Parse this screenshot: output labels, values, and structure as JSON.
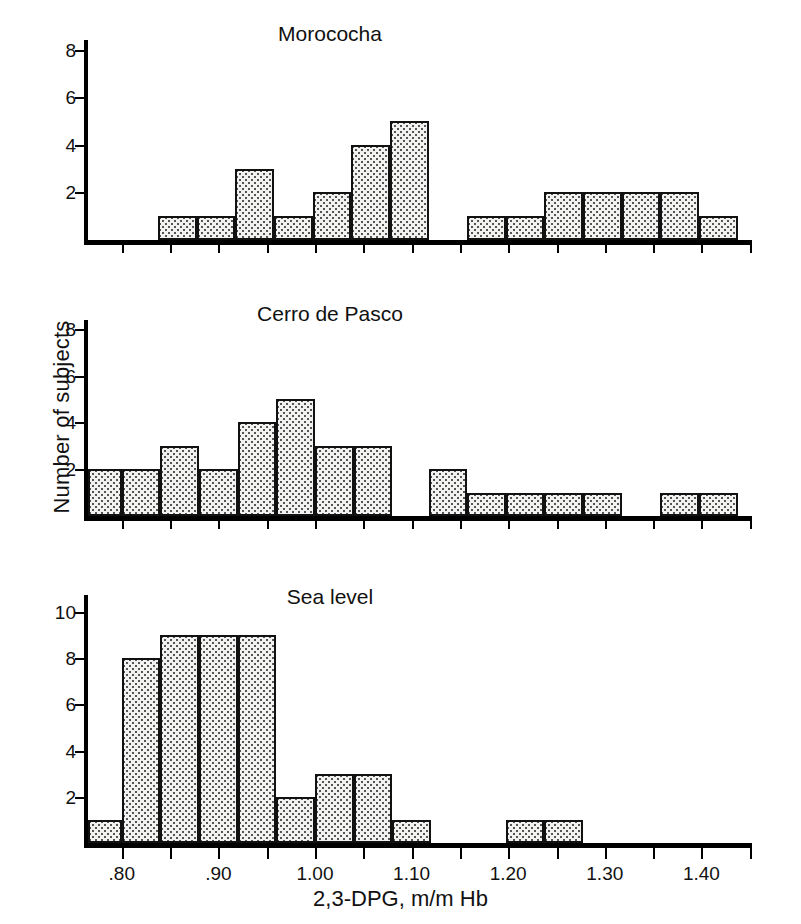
{
  "figure": {
    "y_axis_title": "Number of subjects",
    "x_axis_title": "2,3-DPG, m/m Hb"
  },
  "chart_data": {
    "type": "bar",
    "title": "",
    "xlabel": "2,3-DPG, m/m Hb",
    "ylabel": "Number of subjects",
    "bin_width": 0.04,
    "xlim": [
      0.765,
      1.45
    ],
    "xticks": [
      0.8,
      0.85,
      0.9,
      0.95,
      1.0,
      1.05,
      1.1,
      1.15,
      1.2,
      1.25,
      1.3,
      1.35,
      1.4,
      1.45
    ],
    "xtick_labels": [
      {
        "value": 0.8,
        "label": ".80"
      },
      {
        "value": 0.9,
        "label": ".90"
      },
      {
        "value": 1.0,
        "label": "1.00"
      },
      {
        "value": 1.1,
        "label": "1.10"
      },
      {
        "value": 1.2,
        "label": "1.20"
      },
      {
        "value": 1.3,
        "label": "1.30"
      },
      {
        "value": 1.4,
        "label": "1.40"
      }
    ],
    "panels": [
      {
        "name": "morococha",
        "title": "Morococha",
        "ylim": [
          0,
          8
        ],
        "yticks": [
          2,
          4,
          6,
          8
        ],
        "ytick_labels": [
          "2",
          "4",
          "6",
          "8"
        ],
        "bins": [
          {
            "x0": 0.8375,
            "x1": 0.8775,
            "count": 1
          },
          {
            "x0": 0.8775,
            "x1": 0.9175,
            "count": 1
          },
          {
            "x0": 0.9175,
            "x1": 0.9575,
            "count": 3
          },
          {
            "x0": 0.9575,
            "x1": 0.9975,
            "count": 1
          },
          {
            "x0": 0.9975,
            "x1": 1.0375,
            "count": 2
          },
          {
            "x0": 1.0375,
            "x1": 1.0775,
            "count": 4
          },
          {
            "x0": 1.0775,
            "x1": 1.1175,
            "count": 5
          },
          {
            "x0": 1.1575,
            "x1": 1.1975,
            "count": 1
          },
          {
            "x0": 1.1975,
            "x1": 1.2375,
            "count": 1
          },
          {
            "x0": 1.2375,
            "x1": 1.2775,
            "count": 2
          },
          {
            "x0": 1.2775,
            "x1": 1.3175,
            "count": 2
          },
          {
            "x0": 1.3175,
            "x1": 1.3575,
            "count": 2
          },
          {
            "x0": 1.3575,
            "x1": 1.3975,
            "count": 2
          },
          {
            "x0": 1.3975,
            "x1": 1.4375,
            "count": 1
          }
        ]
      },
      {
        "name": "cerro-de-pasco",
        "title": "Cerro de Pasco",
        "ylim": [
          0,
          9
        ],
        "yticks": [
          2,
          4,
          6,
          8
        ],
        "ytick_labels": [
          "2",
          "4",
          "6",
          "8"
        ],
        "bins": [
          {
            "x0": 0.765,
            "x1": 0.8,
            "count": 2
          },
          {
            "x0": 0.8,
            "x1": 0.84,
            "count": 2
          },
          {
            "x0": 0.84,
            "x1": 0.88,
            "count": 3
          },
          {
            "x0": 0.88,
            "x1": 0.92,
            "count": 2
          },
          {
            "x0": 0.92,
            "x1": 0.96,
            "count": 4
          },
          {
            "x0": 0.96,
            "x1": 1.0,
            "count": 5
          },
          {
            "x0": 1.0,
            "x1": 1.04,
            "count": 3
          },
          {
            "x0": 1.04,
            "x1": 1.08,
            "count": 3
          },
          {
            "x0": 1.1175,
            "x1": 1.1575,
            "count": 2
          },
          {
            "x0": 1.1575,
            "x1": 1.1975,
            "count": 1
          },
          {
            "x0": 1.1975,
            "x1": 1.2375,
            "count": 1
          },
          {
            "x0": 1.2375,
            "x1": 1.2775,
            "count": 1
          },
          {
            "x0": 1.2775,
            "x1": 1.3175,
            "count": 1
          },
          {
            "x0": 1.3575,
            "x1": 1.3975,
            "count": 1
          },
          {
            "x0": 1.3975,
            "x1": 1.4375,
            "count": 1
          }
        ]
      },
      {
        "name": "sea-level",
        "title": "Sea level",
        "ylim": [
          0,
          11
        ],
        "yticks": [
          2,
          4,
          6,
          8,
          10
        ],
        "ytick_labels": [
          "2",
          "4",
          "6",
          "8",
          "10"
        ],
        "bins": [
          {
            "x0": 0.765,
            "x1": 0.8,
            "count": 1
          },
          {
            "x0": 0.8,
            "x1": 0.84,
            "count": 8
          },
          {
            "x0": 0.84,
            "x1": 0.88,
            "count": 9
          },
          {
            "x0": 0.88,
            "x1": 0.92,
            "count": 9
          },
          {
            "x0": 0.92,
            "x1": 0.96,
            "count": 9
          },
          {
            "x0": 0.96,
            "x1": 1.0,
            "count": 2
          },
          {
            "x0": 1.0,
            "x1": 1.04,
            "count": 3
          },
          {
            "x0": 1.04,
            "x1": 1.08,
            "count": 3
          },
          {
            "x0": 1.08,
            "x1": 1.12,
            "count": 1
          },
          {
            "x0": 1.1975,
            "x1": 1.2375,
            "count": 1
          },
          {
            "x0": 1.2375,
            "x1": 1.2775,
            "count": 1
          }
        ]
      }
    ]
  }
}
